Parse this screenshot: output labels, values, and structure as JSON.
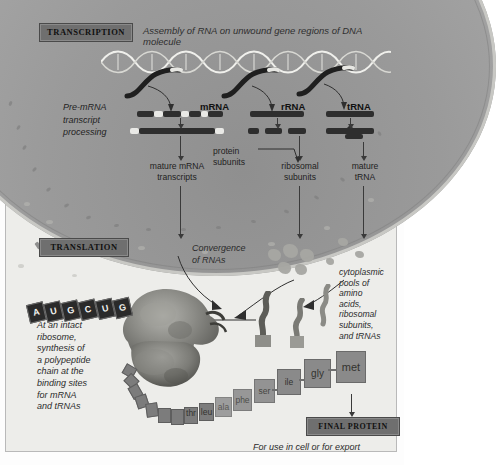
{
  "diagram": {
    "title_transcription": "TRANSCRIPTION",
    "header_text": "Assembly of RNA on unwound gene regions of DNA molecule",
    "title_translation": "TRANSLATION",
    "title_final_protein": "FINAL PROTEIN",
    "export_text": "For use in cell or for export"
  },
  "nucleus": {
    "pre_mrna_text": "Pre-mRNA\ntranscript\nprocessing",
    "rna_labels": {
      "mrna": "mRNA",
      "rrna": "rRNA",
      "trna": "tRNA"
    },
    "products": {
      "mature_mrna": "mature mRNA\ntranscripts",
      "protein_subunits": "protein\nsubunits",
      "ribosomal_subunits": "ribosomal\nsubunits",
      "mature_trna": "mature\ntRNA"
    }
  },
  "cytoplasm": {
    "convergence_text": "Convergence\nof RNAs",
    "pools_text": "cytoplasmic\npools of\namino\nacids,\nribosomal\nsubunits,\nand tRNAs",
    "ribosome_text": "At an intact\nribosome,\nsynthesis of\na polypeptide\nchain at the\nbinding sites\nfor mRNA\nand tRNAs"
  },
  "mrna_strand": {
    "bases": [
      "A",
      "U",
      "G",
      "C",
      "U",
      "G"
    ]
  },
  "polypeptide": {
    "amino_acids": [
      "met",
      "gly",
      "ile",
      "ser",
      "phe",
      "ala",
      "leu",
      "thr"
    ]
  },
  "colors": {
    "nucleus": "#9a9a9a",
    "label_box": "#6f6f6f",
    "background": "#ededea",
    "rna_bar": "#2e2e2e",
    "amino_acid": "#8a8a8a"
  }
}
